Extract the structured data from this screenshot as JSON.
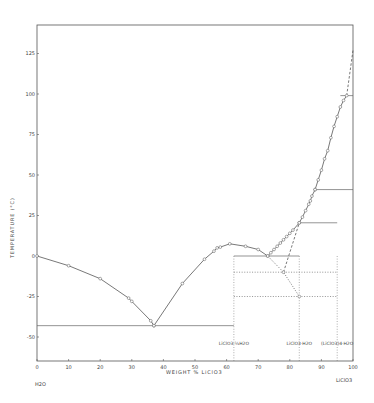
{
  "chart_data": {
    "type": "line",
    "title": "",
    "xlabel": "WEIGHT % LiClO3",
    "ylabel": "TEMPERATURE (°C)",
    "xlim": [
      0,
      100
    ],
    "ylim": [
      -65,
      140
    ],
    "x_ticks": [
      "0",
      "10",
      "20",
      "30",
      "40",
      "50",
      "60",
      "70",
      "80",
      "90",
      "100"
    ],
    "y_ticks": [
      "125",
      "100",
      "75",
      "50",
      "25",
      "0",
      "-25",
      "-50"
    ],
    "x_end_labels": {
      "left": "H2O",
      "right": "LiClO3"
    },
    "grid": false,
    "legend": null,
    "annotations": [
      {
        "text": "LiClO3·⅓H2O",
        "x": 62.3
      },
      {
        "text": "LiClO3·H2O",
        "x": 83
      },
      {
        "text": "(LiClO3)4·H2O",
        "x": 95
      }
    ],
    "series": [
      {
        "name": "Ice branch",
        "style": "solid",
        "points": [
          [
            0,
            0
          ],
          [
            10,
            -6
          ],
          [
            20,
            -14
          ],
          [
            29,
            -26
          ],
          [
            30,
            -28
          ],
          [
            36,
            -40
          ],
          [
            37,
            -43
          ]
        ]
      },
      {
        "name": "LiClO3·⅓H2O branch",
        "style": "solid",
        "points": [
          [
            37,
            -43
          ],
          [
            46,
            -17
          ],
          [
            53,
            -2
          ],
          [
            56,
            3
          ],
          [
            57,
            5
          ],
          [
            58,
            5.5
          ],
          [
            61,
            7.5
          ],
          [
            66,
            6
          ],
          [
            70,
            4
          ],
          [
            73,
            0
          ]
        ]
      },
      {
        "name": "LiClO3·H2O branch",
        "style": "solid",
        "points": [
          [
            73,
            0
          ],
          [
            74,
            2
          ],
          [
            75,
            4
          ],
          [
            76,
            6
          ],
          [
            77,
            8
          ],
          [
            78,
            10
          ],
          [
            79,
            12
          ],
          [
            80,
            14
          ],
          [
            81,
            16
          ],
          [
            83,
            20.5
          ]
        ]
      },
      {
        "name": "(LiClO3)4·H2O branch",
        "style": "solid",
        "points": [
          [
            83,
            20.5
          ],
          [
            84,
            24
          ],
          [
            85,
            28
          ],
          [
            86,
            32
          ],
          [
            86.5,
            34
          ],
          [
            87,
            37
          ],
          [
            88,
            41
          ]
        ]
      },
      {
        "name": "Anhydrous LiClO3 branch",
        "style": "solid",
        "points": [
          [
            88,
            41
          ],
          [
            89,
            47
          ],
          [
            90,
            53
          ],
          [
            91,
            60
          ],
          [
            92,
            65
          ],
          [
            93,
            73
          ],
          [
            94,
            80
          ],
          [
            95,
            86
          ],
          [
            96,
            92
          ],
          [
            97,
            96
          ],
          [
            98,
            99
          ]
        ]
      },
      {
        "name": "Metastable extension to melting",
        "style": "dashed",
        "points": [
          [
            98,
            99
          ],
          [
            100,
            127
          ]
        ]
      },
      {
        "name": "Metastable extension (LiClO3·H2O)",
        "style": "dotted",
        "points": [
          [
            73,
            0
          ],
          [
            78,
            -10
          ],
          [
            83,
            -25
          ]
        ]
      },
      {
        "name": "Metastable extension (to LiClO3·H2O melting)",
        "style": "dashed",
        "points": [
          [
            78,
            -10
          ],
          [
            83,
            20.5
          ]
        ]
      }
    ],
    "invariant_lines": [
      {
        "y": -43,
        "x_range": [
          0,
          62.3
        ],
        "style": "solid"
      },
      {
        "y": 0,
        "x_range": [
          62.3,
          83
        ],
        "style": "solid"
      },
      {
        "y": 20.5,
        "x_range": [
          83,
          95
        ],
        "style": "solid"
      },
      {
        "y": 41,
        "x_range": [
          88,
          100
        ],
        "style": "solid"
      },
      {
        "y": 99,
        "x_range": [
          96,
          100
        ],
        "style": "solid"
      },
      {
        "y": -10,
        "x_range": [
          62.3,
          95
        ],
        "style": "dotted"
      },
      {
        "y": -25,
        "x_range": [
          62.3,
          95
        ],
        "style": "dotted"
      }
    ],
    "composition_lines": [
      {
        "x": 62.3,
        "style": "dotted"
      },
      {
        "x": 83,
        "style": "dotted"
      },
      {
        "x": 95,
        "style": "dotted"
      }
    ]
  }
}
